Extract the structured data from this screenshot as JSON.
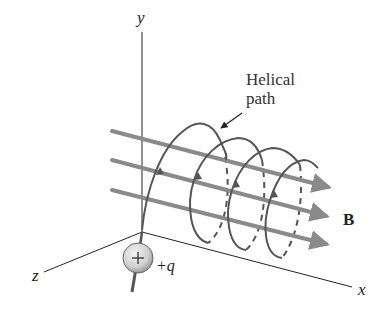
{
  "diagram": {
    "axes": {
      "y_label": "y",
      "z_label": "z",
      "x_label": "x"
    },
    "annotation": {
      "line1": "Helical",
      "line2": "path"
    },
    "field_label": "B",
    "charge": {
      "symbol": "+",
      "label": "+q"
    },
    "colors": {
      "axis": "#222222",
      "field_lines": "#8a8a8a",
      "helix": "#555555",
      "charge_fill": "#d8d8d8",
      "text": "#222222"
    }
  }
}
